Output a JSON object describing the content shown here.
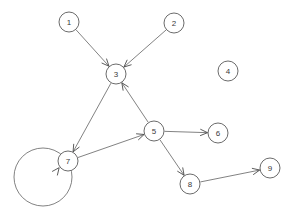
{
  "diagram": {
    "type": "directed-graph",
    "width": 296,
    "height": 220,
    "background_color": "#ffffff",
    "node_stroke_color": "#5a5a5a",
    "node_fill_color": "#ffffff",
    "edge_color": "#6b6b6b",
    "label_color": "#3a3a3a",
    "node_radius": 10,
    "nodes": [
      {
        "id": "1",
        "label": "1",
        "cx": 69,
        "cy": 22,
        "r": 10
      },
      {
        "id": "2",
        "label": "2",
        "cx": 174,
        "cy": 23,
        "r": 10
      },
      {
        "id": "3",
        "label": "3",
        "cx": 116,
        "cy": 74,
        "r": 10
      },
      {
        "id": "4",
        "label": "4",
        "cx": 228,
        "cy": 71,
        "r": 10
      },
      {
        "id": "5",
        "label": "5",
        "cx": 154,
        "cy": 131,
        "r": 10
      },
      {
        "id": "6",
        "label": "6",
        "cx": 218,
        "cy": 133,
        "r": 10
      },
      {
        "id": "7",
        "label": "7",
        "cx": 68,
        "cy": 161,
        "r": 10
      },
      {
        "id": "8",
        "label": "8",
        "cx": 190,
        "cy": 184,
        "r": 10
      },
      {
        "id": "9",
        "label": "9",
        "cx": 270,
        "cy": 168,
        "r": 10
      }
    ],
    "edges": [
      {
        "from": "1",
        "to": "3",
        "directed": true
      },
      {
        "from": "2",
        "to": "3",
        "directed": true
      },
      {
        "from": "3",
        "to": "7",
        "directed": true
      },
      {
        "from": "5",
        "to": "3",
        "directed": true
      },
      {
        "from": "7",
        "to": "5",
        "directed": true
      },
      {
        "from": "5",
        "to": "6",
        "directed": true
      },
      {
        "from": "5",
        "to": "8",
        "directed": true
      },
      {
        "from": "8",
        "to": "9",
        "directed": true
      },
      {
        "from": "7",
        "to": "7",
        "directed": true,
        "self_loop": true
      }
    ],
    "isolated_nodes": [
      "4"
    ],
    "self_loop": {
      "node": "7",
      "cx": 43,
      "cy": 177,
      "r": 29
    }
  }
}
